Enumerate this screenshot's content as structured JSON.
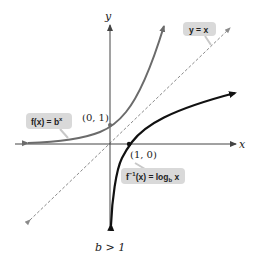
{
  "diagram": {
    "axes": {
      "x_label": "x",
      "y_label": "y"
    },
    "curves": [
      {
        "name": "exponential",
        "label": "f(x) = b",
        "label_sup": "x",
        "color": "#6b6b6b"
      },
      {
        "name": "logarithm",
        "label_prefix": "f",
        "label_sup": "−1",
        "label_mid": "(x) = log",
        "label_sub": "b",
        "label_suffix": " x",
        "color": "#111111"
      },
      {
        "name": "identity",
        "label": "y = x",
        "style": "dashed",
        "color": "#8a8a8a"
      }
    ],
    "points": [
      {
        "label": "(0, 1)"
      },
      {
        "label": "(1, 0)"
      }
    ],
    "condition": "b > 1",
    "colors": {
      "callout_bg": "#d9d9d9",
      "axis": "#444444"
    }
  }
}
